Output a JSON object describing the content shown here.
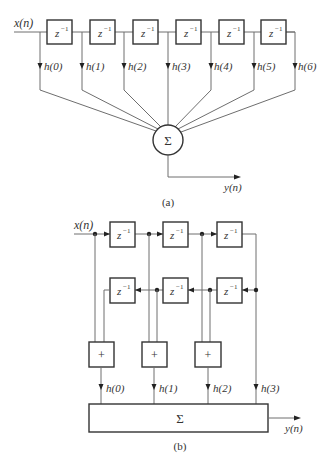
{
  "figure_a": {
    "caption": "(a)",
    "input_label": "x(n)",
    "output_label": "y(n)",
    "delay_label": "z",
    "delay_exp": "−1",
    "sum_symbol": "Σ",
    "delay_count": 6,
    "tap_labels": [
      "h(0)",
      "h(1)",
      "h(2)",
      "h(3)",
      "h(4)",
      "h(5)",
      "h(6)"
    ]
  },
  "figure_b": {
    "caption": "(b)",
    "input_label": "x(n)",
    "output_label": "y(n)",
    "delay_label": "z",
    "delay_exp": "−1",
    "sum_symbol": "Σ",
    "adder_symbol": "+",
    "forward_delay_count": 3,
    "feedback_delay_count": 3,
    "adder_count": 3,
    "tap_labels": [
      "h(0)",
      "h(1)",
      "h(2)",
      "h(3)"
    ]
  }
}
